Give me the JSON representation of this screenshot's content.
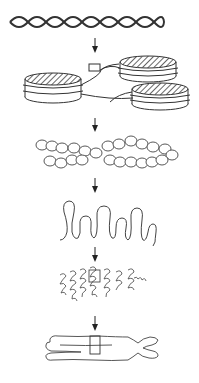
{
  "diagram": {
    "title": "",
    "stages": [
      {
        "id": "dna-double-helix",
        "label": ""
      },
      {
        "id": "nucleosomes",
        "label": ""
      },
      {
        "id": "chromatin-fiber",
        "label": ""
      },
      {
        "id": "looped-domains",
        "label": ""
      },
      {
        "id": "condensed-loops",
        "label": ""
      },
      {
        "id": "metaphase-chromosome",
        "label": ""
      }
    ],
    "arrows": 5,
    "colors": {
      "stroke": "#333333",
      "background": "#ffffff"
    }
  }
}
